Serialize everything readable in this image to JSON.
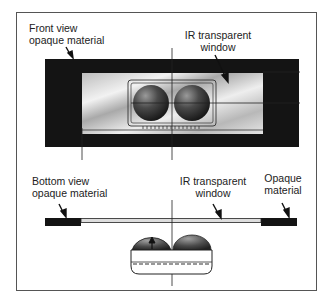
{
  "diagram": {
    "front_view": {
      "label_line1": "Front view",
      "label_line2": "opaque material",
      "window_label_line1": "IR transparent",
      "window_label_line2": "window"
    },
    "bottom_view": {
      "label_line1": "Bottom view",
      "label_line2": "opaque material",
      "window_label_line1": "IR transparent",
      "window_label_line2": "window",
      "right_label_line1": "Opaque",
      "right_label_line2": "material"
    }
  }
}
